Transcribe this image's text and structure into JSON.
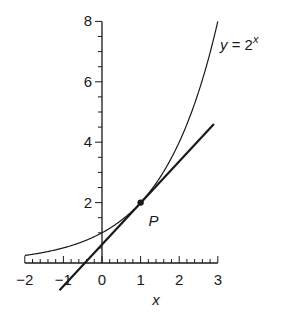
{
  "chart_data": {
    "type": "line",
    "title": "",
    "xlabel": "x",
    "ylabel": "",
    "xlim": [
      -2,
      3
    ],
    "ylim": [
      0,
      8
    ],
    "grid": false,
    "x_ticks": [
      -2,
      -1,
      0,
      1,
      2,
      3
    ],
    "x_tick_labels": [
      "−2",
      "−1",
      "0",
      "1",
      "2",
      "3"
    ],
    "y_ticks": [
      2,
      4,
      6,
      8
    ],
    "y_tick_labels": [
      "2",
      "4",
      "6",
      "8"
    ],
    "series": [
      {
        "name": "y = 2^x",
        "label": "y = 2",
        "label_sup": "x",
        "style": "thin curve",
        "x": [
          -2,
          -1,
          0,
          1,
          2,
          3
        ],
        "values": [
          0.25,
          0.5,
          1,
          2,
          4,
          8
        ]
      },
      {
        "name": "tangent at P",
        "style": "thick line",
        "slope": 1.386,
        "x": [
          -1.1,
          2.9
        ],
        "values": [
          -0.9,
          4.6
        ]
      }
    ],
    "annotations": [
      {
        "label": "P",
        "x": 1,
        "y": 2,
        "marker": "dot"
      }
    ]
  }
}
